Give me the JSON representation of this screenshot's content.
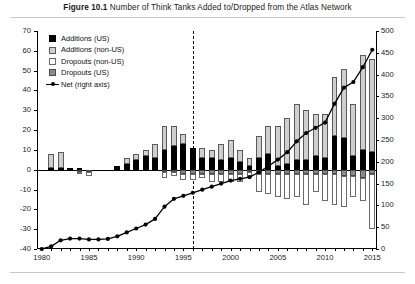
{
  "figure": {
    "label": "Figure 10.1",
    "caption": "Number of Think Tanks Added to/Dropped from the Atlas Network"
  },
  "legend": {
    "position": "top-left",
    "items": [
      {
        "key": "additions_us",
        "label": "Additions (US)",
        "swatch": "solid-black-square",
        "color": "#000000"
      },
      {
        "key": "additions_non_us",
        "label": "Additions (non-US)",
        "swatch": "light-gray-square",
        "color": "#cfcfcf"
      },
      {
        "key": "dropouts_non_us",
        "label": "Dropouts (non-US)",
        "swatch": "white-square",
        "color": "#ffffff"
      },
      {
        "key": "dropouts_us",
        "label": "Dropouts (US)",
        "swatch": "mid-gray-square",
        "color": "#8a8a8a"
      },
      {
        "key": "net",
        "label": "Net (right axis)",
        "swatch": "line-with-dot-marker",
        "color": "#000000"
      }
    ]
  },
  "axes": {
    "left": {
      "ticks": [
        70,
        60,
        50,
        40,
        30,
        20,
        10,
        0,
        -10,
        -20,
        -30,
        -40
      ],
      "min": -40,
      "max": 70,
      "step": 10
    },
    "right": {
      "ticks": [
        500,
        450,
        400,
        350,
        300,
        250,
        200,
        150,
        100,
        50,
        0
      ],
      "min": 0,
      "max": 500,
      "step": 50,
      "label": "Net (right axis)"
    },
    "x": {
      "ticks": [
        1980,
        1985,
        1990,
        1995,
        2000,
        2005,
        2010,
        2015
      ],
      "min": 1980,
      "max": 2015
    }
  },
  "annotations": {
    "dashed_vertical_year": 1996
  },
  "chart_data": {
    "type": "bar",
    "title": "Number of Think Tanks Added to/Dropped from the Atlas Network",
    "subtitle": "Figure 10.1",
    "xlabel": "",
    "ylabel": "",
    "grid": false,
    "legend_position": "top-left",
    "stacked": true,
    "categories": [
      1980,
      1981,
      1982,
      1983,
      1984,
      1985,
      1986,
      1987,
      1988,
      1989,
      1990,
      1991,
      1992,
      1993,
      1994,
      1995,
      1996,
      1997,
      1998,
      1999,
      2000,
      2001,
      2002,
      2003,
      2004,
      2005,
      2006,
      2007,
      2008,
      2009,
      2010,
      2011,
      2012,
      2013,
      2014,
      2015
    ],
    "ylim": [
      -40,
      70
    ],
    "y2lim": [
      0,
      500
    ],
    "series": [
      {
        "name": "Additions (US)",
        "axis": "left",
        "color": "#000000",
        "values": [
          0,
          1,
          1,
          1,
          1,
          0,
          0,
          0,
          2,
          3,
          5,
          7,
          6,
          10,
          12,
          13,
          11,
          6,
          6,
          5,
          6,
          4,
          2,
          6,
          8,
          2,
          3,
          5,
          5,
          7,
          6,
          17,
          16,
          7,
          10,
          9
        ]
      },
      {
        "name": "Additions (non-US)",
        "axis": "left",
        "color": "#cfcfcf",
        "values": [
          0,
          7,
          8,
          0,
          0,
          0,
          0,
          0,
          0,
          3,
          3,
          3,
          7,
          12,
          10,
          5,
          0,
          5,
          4,
          8,
          9,
          6,
          4,
          11,
          14,
          20,
          23,
          28,
          25,
          21,
          22,
          30,
          35,
          26,
          48,
          47
        ]
      },
      {
        "name": "Dropouts (US)",
        "axis": "left",
        "color": "#8a8a8a",
        "values": [
          0,
          0,
          0,
          0,
          -1,
          -1,
          0,
          0,
          0,
          0,
          0,
          0,
          0,
          -1,
          -1,
          -2,
          -2,
          -2,
          -2,
          -2,
          -2,
          -2,
          -1,
          -2,
          -2,
          -2,
          -2,
          -2,
          -2,
          -2,
          -2,
          -2,
          -3,
          -3,
          -4,
          -2
        ]
      },
      {
        "name": "Dropouts (non-US)",
        "axis": "left",
        "color": "#ffffff",
        "values": [
          0,
          0,
          0,
          0,
          -1,
          -2,
          0,
          0,
          0,
          0,
          0,
          0,
          0,
          -3,
          -2,
          -3,
          -3,
          -2,
          -4,
          -4,
          -4,
          -4,
          -3,
          -9,
          -10,
          -12,
          -13,
          -12,
          -16,
          -9,
          -14,
          -16,
          -16,
          -11,
          -12,
          -28
        ]
      },
      {
        "name": "Net (right axis)",
        "axis": "right",
        "type": "line",
        "marker": "circle",
        "color": "#000000",
        "values": [
          0,
          6,
          20,
          24,
          24,
          22,
          22,
          23,
          29,
          38,
          47,
          56,
          69,
          97,
          115,
          122,
          129,
          136,
          143,
          150,
          157,
          161,
          165,
          176,
          190,
          205,
          222,
          247,
          266,
          278,
          290,
          333,
          370,
          383,
          417,
          457
        ]
      }
    ]
  }
}
